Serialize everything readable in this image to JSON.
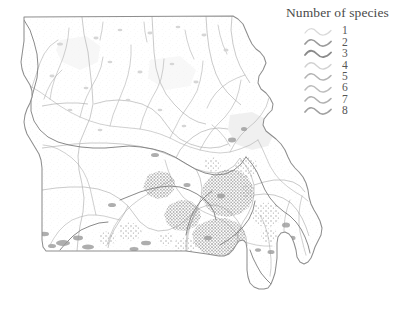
{
  "figure": {
    "kind": "thematic-map",
    "region": "Missouri",
    "background_color": "#ffffff"
  },
  "legend": {
    "title": "Number of species",
    "symbol_name": "wavy-stream-line",
    "entries": [
      {
        "label": "1",
        "value": 1,
        "color": "#d9d9d9"
      },
      {
        "label": "2",
        "value": 2,
        "color": "#9a9a9a"
      },
      {
        "label": "3",
        "value": 3,
        "color": "#8a8a8a"
      },
      {
        "label": "4",
        "value": 4,
        "color": "#d2d2d2"
      },
      {
        "label": "5",
        "value": 5,
        "color": "#b4b4b4"
      },
      {
        "label": "6",
        "value": 6,
        "color": "#bdbdbd"
      },
      {
        "label": "7",
        "value": 7,
        "color": "#b0b0b0"
      },
      {
        "label": "8",
        "value": 8,
        "color": "#a0a0a0"
      }
    ]
  },
  "map": {
    "state_outline_color": "#8e8e8e",
    "watershed_boundary_color": "#b8b8b8",
    "stream_color": "#9d9d9d",
    "dense_cluster_color": "#8d8d8d",
    "light_shade_color": "#e8e8e8",
    "state_fill_color": "#fdfdfd",
    "state_outline_name": "missouri-state-boundary",
    "watersheds_name": "watershed-boundaries",
    "streams_name": "stream-network",
    "clusters_name": "species-richness-clusters"
  }
}
